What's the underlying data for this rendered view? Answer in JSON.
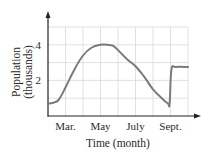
{
  "chart_data": {
    "type": "line",
    "title": "",
    "xlabel": "Time (month)",
    "ylabel": "Population (thousands)",
    "ylabel_lines": [
      "Population",
      "(thousands)"
    ],
    "x_tick_labels": [
      "Mar.",
      "May",
      "July",
      "Sept."
    ],
    "x_tick_positions_month_index": [
      1,
      3,
      5,
      7
    ],
    "y_tick_labels": [
      "2",
      "4"
    ],
    "y_tick_values": [
      2,
      4
    ],
    "xlim_months": [
      "Feb",
      "Oct"
    ],
    "ylim": [
      0,
      5
    ],
    "grid": true,
    "legend": null,
    "series": [
      {
        "name": "Population",
        "note": "Approximate values read from the curve; month index 0 = Feb, 1 = Mar, ..., 8 = Oct",
        "x": [
          0,
          0.3,
          0.6,
          1.0,
          1.5,
          2.0,
          2.5,
          3.0,
          3.4,
          3.7,
          4.0,
          4.5,
          5.0,
          5.5,
          6.0,
          6.5,
          6.85,
          6.95,
          7.05,
          7.3,
          8.0
        ],
        "values": [
          0.7,
          0.75,
          0.9,
          1.6,
          2.6,
          3.4,
          3.85,
          4.0,
          4.0,
          3.95,
          3.7,
          3.2,
          2.8,
          2.2,
          1.5,
          1.0,
          0.7,
          0.7,
          2.6,
          2.75,
          2.75
        ]
      }
    ]
  },
  "colors": {
    "curve": "#7a7a7a",
    "axis": "#222222",
    "grid": "#d9d9d9",
    "text": "#2a2a2a"
  }
}
